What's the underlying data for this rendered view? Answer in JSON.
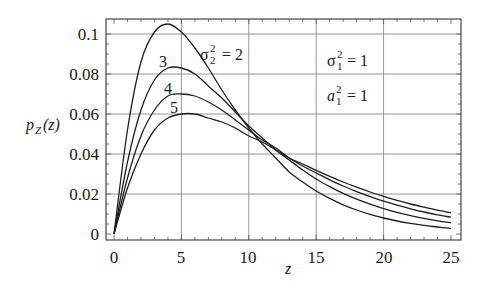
{
  "chart_data": {
    "type": "line",
    "title": "",
    "xlabel": "z",
    "ylabel": "p_Z(z)",
    "xlim": [
      0,
      25
    ],
    "ylim": [
      0,
      0.105
    ],
    "grid": true,
    "legend": "none (inline curve labels)",
    "x_ticks": [
      "0",
      "5",
      "10",
      "15",
      "20",
      "25"
    ],
    "y_ticks": [
      "0",
      "0.02",
      "0.04",
      "0.06",
      "0.08",
      "0.1"
    ],
    "x": [
      0,
      1,
      2,
      3,
      4,
      5,
      6,
      7,
      8,
      9,
      10,
      11,
      12,
      13,
      14,
      15,
      16,
      17,
      18,
      19,
      20,
      21,
      22,
      23,
      24,
      25
    ],
    "series": [
      {
        "name": "σ₂² = 2",
        "label": "σ₂² = 2",
        "values": [
          0,
          0.052,
          0.086,
          0.101,
          0.105,
          0.101,
          0.093,
          0.083,
          0.072,
          0.062,
          0.053,
          0.045,
          0.038,
          0.031,
          0.026,
          0.0215,
          0.0178,
          0.0146,
          0.012,
          0.0098,
          0.008,
          0.0065,
          0.0053,
          0.0043,
          0.0035,
          0.0028
        ]
      },
      {
        "name": "σ₂² = 3",
        "label": "3",
        "values": [
          0,
          0.036,
          0.062,
          0.077,
          0.083,
          0.083,
          0.08,
          0.074,
          0.068,
          0.061,
          0.054,
          0.048,
          0.042,
          0.037,
          0.032,
          0.0275,
          0.0237,
          0.0203,
          0.0174,
          0.0149,
          0.0127,
          0.0108,
          0.0092,
          0.0078,
          0.0066,
          0.0056
        ]
      },
      {
        "name": "σ₂² = 4",
        "label": "4",
        "values": [
          0,
          0.028,
          0.049,
          0.062,
          0.069,
          0.07,
          0.069,
          0.066,
          0.062,
          0.057,
          0.052,
          0.047,
          0.043,
          0.038,
          0.034,
          0.0305,
          0.0271,
          0.024,
          0.0212,
          0.0187,
          0.0164,
          0.0144,
          0.0126,
          0.011,
          0.0096,
          0.0084
        ]
      },
      {
        "name": "σ₂² = 5",
        "label": "5",
        "values": [
          0,
          0.023,
          0.04,
          0.052,
          0.058,
          0.06,
          0.06,
          0.058,
          0.056,
          0.053,
          0.049,
          0.046,
          0.042,
          0.038,
          0.035,
          0.0318,
          0.0288,
          0.026,
          0.0234,
          0.021,
          0.0188,
          0.0168,
          0.015,
          0.0134,
          0.0119,
          0.0106
        ]
      }
    ],
    "annotations": [
      {
        "text": "σ₂² = 2",
        "near": "peak of first curve"
      },
      {
        "text": "3",
        "near": "second curve peak"
      },
      {
        "text": "4",
        "near": "third curve peak"
      },
      {
        "text": "5",
        "near": "fourth curve peak"
      },
      {
        "text": "σ₁² = 1",
        "position": "upper right"
      },
      {
        "text": "a₁² = 1",
        "position": "upper right, below σ₁²"
      }
    ]
  },
  "axes": {
    "xlabel": "z",
    "ylabel_main": "p",
    "ylabel_sub": "Z",
    "ylabel_arg": "(z)",
    "x_ticks": [
      "0",
      "5",
      "10",
      "15",
      "20",
      "25"
    ],
    "y_ticks": [
      "0",
      "0.02",
      "0.04",
      "0.06",
      "0.08",
      "0.1"
    ]
  },
  "annotations": {
    "sigma2_main": "σ",
    "sigma2_sup": "2",
    "sigma2_sub": "2",
    "sigma2_eq": "= 2",
    "label3": "3",
    "label4": "4",
    "label5": "5",
    "sigma1_main": "σ",
    "sigma1_sup": "2",
    "sigma1_sub": "1",
    "sigma1_eq": "= 1",
    "a1_main": "a",
    "a1_sup": "2",
    "a1_sub": "1",
    "a1_eq": "= 1"
  }
}
